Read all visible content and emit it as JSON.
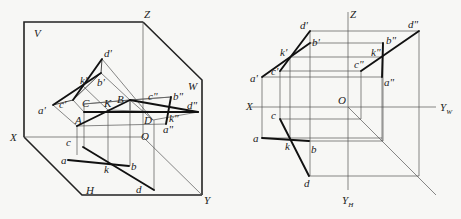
{
  "figure": {
    "left_diagram": {
      "plane_labels": {
        "V": "V",
        "H": "H",
        "W": "W"
      },
      "axis_labels": {
        "X": "X",
        "Y": "Y",
        "Z": "Z",
        "O": "O"
      },
      "space_points": {
        "A": "A",
        "B": "B",
        "C": "C",
        "D": "D",
        "K": "K"
      },
      "front_projection": {
        "a": "a'",
        "b": "b'",
        "c": "c'",
        "d": "d'",
        "k": "k'"
      },
      "side_projection": {
        "a": "a\"",
        "b": "b\"",
        "c": "c\"",
        "d": "d\"",
        "k": "k\""
      },
      "top_projection": {
        "a": "a",
        "b": "b",
        "c": "c",
        "d": "d",
        "k": "k"
      }
    },
    "right_diagram": {
      "axis_labels": {
        "X": "X",
        "Z": "Z",
        "O": "O",
        "YW": "Y",
        "YW_sub": "W",
        "YH": "Y",
        "YH_sub": "H"
      },
      "front_projection": {
        "a": "a'",
        "b": "b'",
        "c": "c'",
        "d": "d'",
        "k": "k'"
      },
      "side_projection": {
        "a": "a\"",
        "b": "b\"",
        "c": "c\"",
        "d": "d\"",
        "k": "k\""
      },
      "top_projection": {
        "a": "a",
        "b": "b",
        "c": "c",
        "d": "d",
        "k": "k"
      }
    }
  }
}
